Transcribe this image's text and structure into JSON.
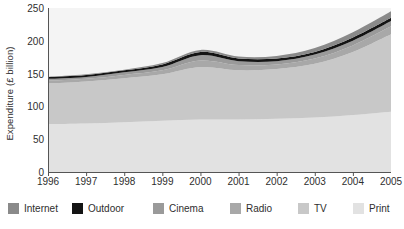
{
  "chart_data": {
    "type": "area",
    "stacked": true,
    "title": "",
    "subtitle": "",
    "xlabel": "",
    "ylabel": "Expenditure (£ billion)",
    "categories": [
      "1996",
      "1997",
      "1998",
      "1999",
      "2000",
      "2001",
      "2002",
      "2003",
      "2004",
      "2005"
    ],
    "x": [
      1996,
      1997,
      1998,
      1999,
      2000,
      2001,
      2002,
      2003,
      2004,
      2005
    ],
    "xlim": [
      1996,
      2005
    ],
    "ylim": [
      0,
      250
    ],
    "yticks": [
      0,
      50,
      100,
      150,
      200,
      250
    ],
    "grid": false,
    "legend_position": "bottom",
    "stack_order_bottom_to_top": [
      "Print",
      "TV",
      "Radio",
      "Cinema",
      "Outdoor",
      "Internet"
    ],
    "series": [
      {
        "name": "Print",
        "color": "#e2e2e2",
        "values": [
          73,
          74,
          76,
          78,
          80,
          80,
          81,
          83,
          87,
          92
        ]
      },
      {
        "name": "TV",
        "color": "#c8c8c8",
        "values": [
          62,
          64,
          67,
          71,
          80,
          75,
          76,
          82,
          96,
          118
        ]
      },
      {
        "name": "Radio",
        "color": "#a8a8a8",
        "values": [
          4,
          4,
          5,
          6,
          10,
          8,
          7,
          8,
          10,
          12
        ]
      },
      {
        "name": "Cinema",
        "color": "#9a9a9a",
        "values": [
          3,
          3,
          4,
          5,
          8,
          6,
          5,
          6,
          7,
          8
        ]
      },
      {
        "name": "Outdoor",
        "color": "#141414",
        "values": [
          3,
          3,
          3,
          4,
          5,
          4,
          4,
          4,
          5,
          5
        ]
      },
      {
        "name": "Internet",
        "color": "#8a8a8a",
        "values": [
          0,
          1,
          1,
          2,
          3,
          3,
          4,
          6,
          8,
          10
        ]
      }
    ],
    "totals": [
      145,
      149,
      156,
      166,
      186,
      176,
      177,
      189,
      213,
      245
    ]
  },
  "axes": {
    "y_tick_labels": [
      "250",
      "200",
      "150",
      "100",
      "50",
      "0"
    ],
    "x_tick_labels": [
      "1996",
      "1997",
      "1998",
      "1999",
      "2000",
      "2001",
      "2002",
      "2003",
      "2004",
      "2005"
    ],
    "y_title": "Expenditure (£ billion)"
  },
  "legend": {
    "items": [
      {
        "label": "Internet",
        "color": "#8a8a8a"
      },
      {
        "label": "Outdoor",
        "color": "#141414"
      },
      {
        "label": "Cinema",
        "color": "#9a9a9a"
      },
      {
        "label": "Radio",
        "color": "#a8a8a8"
      },
      {
        "label": "TV",
        "color": "#c8c8c8"
      },
      {
        "label": "Print",
        "color": "#e2e2e2"
      }
    ]
  },
  "style": {
    "plot_background": "#f4f4f4",
    "figure_background": "#ffffff",
    "axis_color": "#555555",
    "text_color": "#2e2e2e"
  }
}
